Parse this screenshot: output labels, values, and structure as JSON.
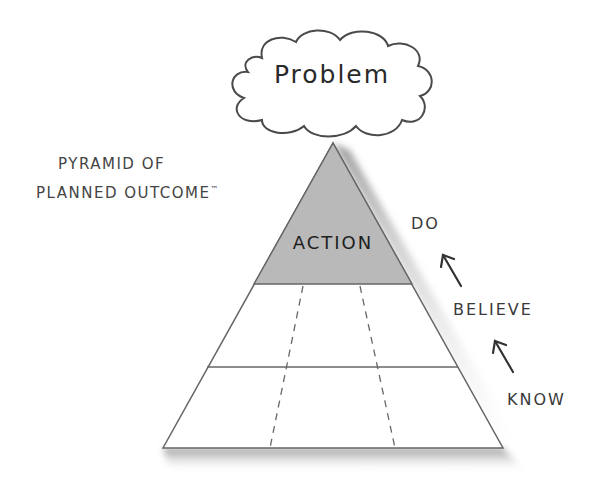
{
  "cloud": {
    "label": "Problem"
  },
  "title": {
    "line1": "PYRAMID OF",
    "line2": "PLANNED OUTCOME",
    "trademark": "™"
  },
  "pyramid": {
    "top_tier_label": "ACTION",
    "tiers": [
      "ACTION",
      "",
      ""
    ],
    "fill_top": "#b9b9b9",
    "stroke": "#666666"
  },
  "progression": {
    "steps": [
      "DO",
      "BELIEVE",
      "KNOW"
    ],
    "arrow_icon": "arrow-up-left"
  }
}
